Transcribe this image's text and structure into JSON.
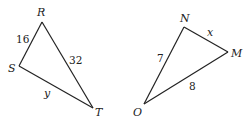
{
  "diagram": {
    "type": "two triangles",
    "triangles": [
      {
        "name": "RST",
        "vertices": {
          "R": {
            "label": "R"
          },
          "S": {
            "label": "S"
          },
          "T": {
            "label": "T"
          }
        },
        "sides": [
          {
            "between": "RS",
            "label": "16"
          },
          {
            "between": "RT",
            "label": "32"
          },
          {
            "between": "ST",
            "label": "y"
          }
        ]
      },
      {
        "name": "NMO",
        "vertices": {
          "N": {
            "label": "N"
          },
          "M": {
            "label": "M"
          },
          "O": {
            "label": "O"
          }
        },
        "sides": [
          {
            "between": "NM",
            "label": "x"
          },
          {
            "between": "NO",
            "label": "7"
          },
          {
            "between": "OM",
            "label": "8"
          }
        ]
      }
    ]
  }
}
